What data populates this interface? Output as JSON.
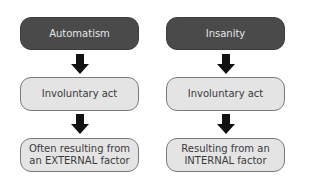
{
  "diagram": {
    "colors": {
      "header_fill": "#4a4a4a",
      "header_text": "#e6e6e6",
      "box_fill": "#e4e4e4",
      "box_border": "#7a7a7a",
      "box_text": "#3a3a3a",
      "arrow": "#111111"
    },
    "columns": [
      {
        "title": "Automatism",
        "steps": [
          "Involuntary act",
          "Often resulting from an EXTERNAL factor"
        ]
      },
      {
        "title": "Insanity",
        "steps": [
          "Involuntary act",
          "Resulting from an INTERNAL factor"
        ]
      }
    ],
    "arrow_icon": "down-arrow-icon"
  }
}
